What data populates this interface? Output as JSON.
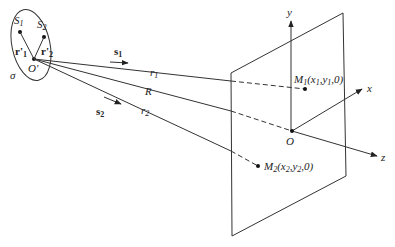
{
  "diagram": {
    "type": "geometry-optics",
    "source_region": {
      "label": "σ",
      "origin_label": "O'",
      "points": [
        {
          "label": "S",
          "sub": "1"
        },
        {
          "label": "S",
          "sub": "2"
        }
      ],
      "vectors": [
        {
          "label": "r'",
          "sub": "1"
        },
        {
          "label": "r'",
          "sub": "2"
        }
      ]
    },
    "rays": [
      {
        "label": "r",
        "sub": "1",
        "direction": {
          "label": "s",
          "sub": "1"
        }
      },
      {
        "label": "R"
      },
      {
        "label": "r",
        "sub": "2",
        "direction": {
          "label": "s",
          "sub": "2"
        }
      }
    ],
    "observation_plane": {
      "origin": "O",
      "axes": [
        "x",
        "y",
        "z"
      ],
      "points": [
        {
          "label": "M",
          "sub": "1",
          "coords": "(x₁,y₁,0)"
        },
        {
          "label": "M",
          "sub": "2",
          "coords": "(x₂,y₂,0)"
        }
      ]
    }
  },
  "labels": {
    "S1": "S",
    "S1_sub": "1",
    "S2": "S",
    "S2_sub": "2",
    "r1p": "r'",
    "r1p_sub": "1",
    "r2p": "r'",
    "r2p_sub": "2",
    "sigma": "σ",
    "Oprime": "O'",
    "s1": "s",
    "s1_sub": "1",
    "s2": "s",
    "s2_sub": "2",
    "r1": "r",
    "r1_sub": "1",
    "R": "R",
    "r2": "r",
    "r2_sub": "2",
    "M1": "M",
    "M1_sub": "1",
    "M1_coords_a": "(x",
    "M1_coords_a_sub": "1",
    "M1_coords_b": ",y",
    "M1_coords_b_sub": "1",
    "M1_coords_c": ",0)",
    "M2": "M",
    "M2_sub": "2",
    "M2_coords_a": "(x",
    "M2_coords_a_sub": "2",
    "M2_coords_b": ",y",
    "M2_coords_b_sub": "2",
    "M2_coords_c": ",0)",
    "O": "O",
    "x": "x",
    "y": "y",
    "z": "z"
  }
}
